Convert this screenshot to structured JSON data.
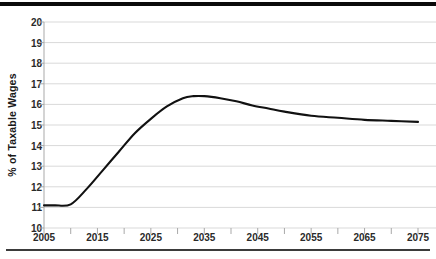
{
  "chart_data": {
    "type": "line",
    "title": "",
    "xlabel": "",
    "ylabel": "% of Taxable Wages",
    "xlim": [
      2005,
      2075
    ],
    "ylim": [
      10,
      20
    ],
    "grid": true,
    "legend": "none",
    "y_ticks": [
      20,
      19,
      18,
      17,
      16,
      15,
      14,
      13,
      12,
      11,
      10
    ],
    "x_ticks": [
      2005,
      2015,
      2025,
      2035,
      2045,
      2055,
      2065,
      2075
    ],
    "x_minor_step": 5,
    "series": [
      {
        "name": "Cost as % of Taxable Wages",
        "color": "#111111",
        "x": [
          2005,
          2007,
          2010,
          2013,
          2016,
          2019,
          2022,
          2025,
          2028,
          2031,
          2033,
          2035,
          2038,
          2041,
          2044,
          2047,
          2050,
          2055,
          2060,
          2065,
          2070,
          2075
        ],
        "values": [
          11.1,
          11.1,
          11.15,
          11.9,
          12.8,
          13.7,
          14.6,
          15.3,
          15.9,
          16.3,
          16.4,
          16.4,
          16.3,
          16.15,
          15.95,
          15.8,
          15.65,
          15.45,
          15.35,
          15.25,
          15.2,
          15.15
        ]
      }
    ]
  },
  "colors": {
    "line": "#111111",
    "grid": "#d9d9d9",
    "axis": "#a9a9a9",
    "rule": "#0a0a0a",
    "text": "#2a2a2a"
  }
}
